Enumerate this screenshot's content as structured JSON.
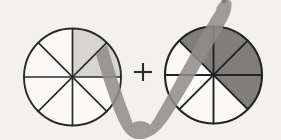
{
  "figure": {
    "title": "Fraction addition diagram: two eighths plus four eighths",
    "background_color": "#f3f1ee",
    "width": 281,
    "height": 140,
    "operator": {
      "symbol": "+",
      "name": "plus-sign",
      "color": "#2b2b2b",
      "x": 143,
      "y": 72,
      "size": 21
    },
    "annotation": {
      "name": "check-mark-stroke",
      "shape": "checkmark",
      "color": "#8c8a88",
      "description": "large hand-drawn grey check mark overlaying the two circles"
    }
  },
  "circles": [
    {
      "name": "left-fraction-circle",
      "label": "2/8",
      "cx": 72.5,
      "cy": 77,
      "r": 48.5,
      "sectors": 8,
      "shaded_count": 2,
      "shaded_indices": [
        0,
        1
      ],
      "shaded_color": "#d6d4d1",
      "unshaded_color": "#fbfaf8",
      "outline_color": "#2b2b2b",
      "outline_width": 1.7
    },
    {
      "name": "right-fraction-circle",
      "label": "4/8",
      "cx": 213.5,
      "cy": 75,
      "r": 48.5,
      "sectors": 8,
      "shaded_count": 4,
      "shaded_indices": [
        0,
        1,
        2,
        7
      ],
      "shaded_color": "#807e7c",
      "unshaded_color": "#fbfaf8",
      "outline_color": "#222222",
      "outline_width": 1.9
    }
  ]
}
